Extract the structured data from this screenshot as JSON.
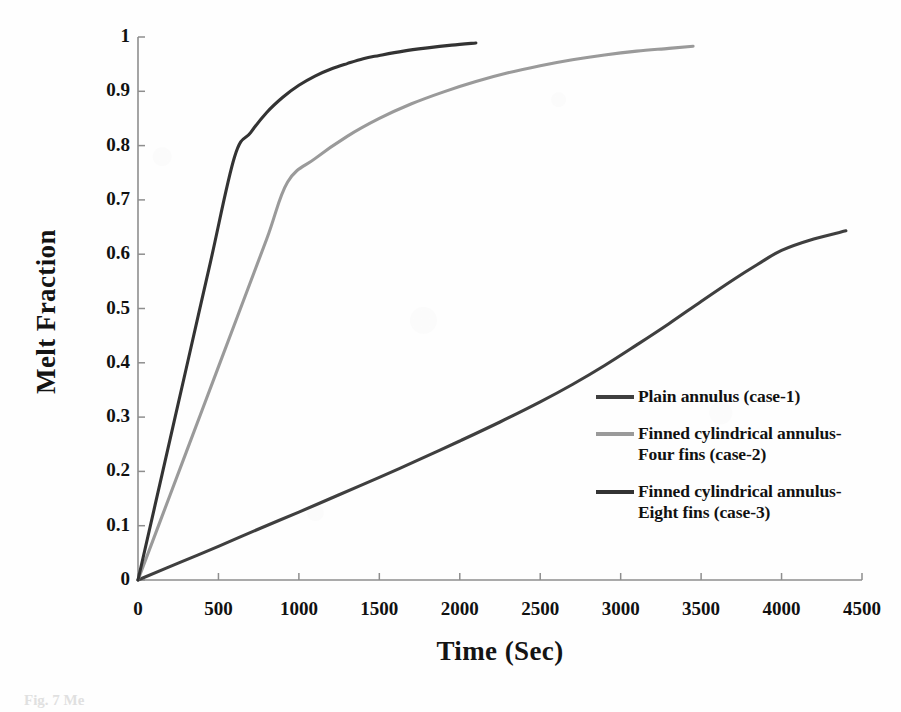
{
  "chart_data": {
    "type": "line",
    "title": "",
    "xlabel": "Time (Sec)",
    "ylabel": "Melt Fraction",
    "xlim": [
      0,
      4500
    ],
    "ylim": [
      0,
      1
    ],
    "xticks": [
      0,
      500,
      1000,
      1500,
      2000,
      2500,
      3000,
      3500,
      4000,
      4500
    ],
    "xtick_labels": [
      "0",
      "500",
      "1000",
      "1500",
      "2000",
      "2500",
      "3000",
      "3500",
      "4000",
      "4500"
    ],
    "yticks": [
      0,
      0.1,
      0.2,
      0.3,
      0.4,
      0.5,
      0.6,
      0.7,
      0.8,
      0.9,
      1
    ],
    "ytick_labels": [
      "0",
      "0.1",
      "0.2",
      "0.3",
      "0.4",
      "0.5",
      "0.6",
      "0.7",
      "0.8",
      "0.9",
      "1"
    ],
    "grid": false,
    "legend_position": "center-right inside axes",
    "series": [
      {
        "name": "Plain annulus (case-1)",
        "color": "#3f3f3f",
        "points": [
          [
            0,
            0
          ],
          [
            250,
            0.031
          ],
          [
            500,
            0.062
          ],
          [
            750,
            0.094
          ],
          [
            1000,
            0.125
          ],
          [
            1250,
            0.157
          ],
          [
            1500,
            0.189
          ],
          [
            1750,
            0.222
          ],
          [
            2000,
            0.256
          ],
          [
            2250,
            0.291
          ],
          [
            2500,
            0.328
          ],
          [
            2700,
            0.36
          ],
          [
            2900,
            0.395
          ],
          [
            3100,
            0.433
          ],
          [
            3300,
            0.472
          ],
          [
            3500,
            0.513
          ],
          [
            3700,
            0.553
          ],
          [
            3850,
            0.581
          ],
          [
            4000,
            0.607
          ],
          [
            4200,
            0.628
          ],
          [
            4400,
            0.643
          ],
          [
            4600,
            0.653
          ],
          [
            4800,
            0.66
          ],
          [
            5000,
            0.663
          ]
        ]
      },
      {
        "name": "Finned cylindrical annulus-Four fins (case-2)",
        "color": "#9a9a9a",
        "points": [
          [
            0,
            0
          ],
          [
            200,
            0.157
          ],
          [
            400,
            0.314
          ],
          [
            600,
            0.471
          ],
          [
            800,
            0.628
          ],
          [
            930,
            0.733
          ],
          [
            1100,
            0.776
          ],
          [
            1300,
            0.817
          ],
          [
            1500,
            0.85
          ],
          [
            1700,
            0.877
          ],
          [
            1900,
            0.899
          ],
          [
            2100,
            0.918
          ],
          [
            2300,
            0.934
          ],
          [
            2500,
            0.947
          ],
          [
            2700,
            0.958
          ],
          [
            2900,
            0.967
          ],
          [
            3100,
            0.974
          ],
          [
            3300,
            0.979
          ],
          [
            3450,
            0.983
          ]
        ]
      },
      {
        "name": "Finned cylindrical annulus-Eight fins (case-3)",
        "color": "#333333",
        "points": [
          [
            0,
            0
          ],
          [
            150,
            0.195
          ],
          [
            300,
            0.39
          ],
          [
            450,
            0.585
          ],
          [
            600,
            0.779
          ],
          [
            700,
            0.824
          ],
          [
            800,
            0.861
          ],
          [
            900,
            0.889
          ],
          [
            1000,
            0.911
          ],
          [
            1100,
            0.928
          ],
          [
            1200,
            0.941
          ],
          [
            1300,
            0.951
          ],
          [
            1400,
            0.96
          ],
          [
            1500,
            0.966
          ],
          [
            1650,
            0.974
          ],
          [
            1800,
            0.98
          ],
          [
            1950,
            0.985
          ],
          [
            2100,
            0.989
          ]
        ]
      }
    ]
  },
  "axes": {
    "y_title": "Melt Fraction",
    "x_title": "Time (Sec)"
  },
  "legend": {
    "entries": [
      {
        "label": "Plain annulus (case-1)",
        "color": "#3f3f3f"
      },
      {
        "label": "Finned cylindrical annulus-\nFour fins (case-2)",
        "color": "#9a9a9a"
      },
      {
        "label": "Finned cylindrical annulus-\nEight fins (case-3)",
        "color": "#333333"
      }
    ]
  },
  "caption": "Fig. 7 Me"
}
